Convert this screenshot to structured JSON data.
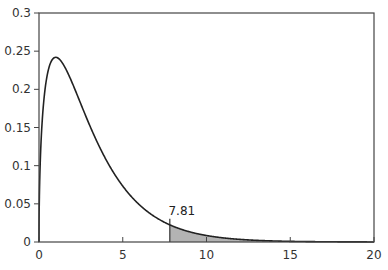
{
  "chart_data": {
    "type": "area",
    "title": "",
    "xlabel": "",
    "ylabel": "",
    "distribution": "chi-square",
    "degrees_of_freedom": 3,
    "xlim": [
      0,
      20
    ],
    "ylim": [
      0,
      0.3
    ],
    "x_ticks": [
      0,
      5,
      10,
      15,
      20
    ],
    "x_tick_labels": [
      "0",
      "5",
      "10",
      "15",
      "20"
    ],
    "y_ticks": [
      0,
      0.05,
      0.1,
      0.15,
      0.2,
      0.25,
      0.3
    ],
    "y_tick_labels": [
      "0",
      "0.05",
      "0.1",
      "0.15",
      "0.2",
      "0.25",
      "0.3"
    ],
    "grid": false,
    "legend": null,
    "series": [
      {
        "name": "density",
        "x": [
          0,
          0.25,
          0.5,
          1,
          1.5,
          2,
          3,
          4,
          5,
          6,
          7,
          7.81,
          9,
          10,
          12,
          15,
          20
        ],
        "values": [
          0,
          0.176,
          0.22,
          0.242,
          0.231,
          0.208,
          0.154,
          0.108,
          0.073,
          0.049,
          0.032,
          0.023,
          0.013,
          0.008,
          0.003,
          0.001,
          0.0001
        ]
      }
    ],
    "shaded_region": {
      "from": 7.81,
      "to": 20,
      "color": "#b3b3b3"
    },
    "annotations": [
      {
        "text": "7.81",
        "x": 7.81,
        "y": 0.023
      }
    ],
    "colors": {
      "curve": "#222222",
      "axis": "#444444",
      "shade": "#b3b3b3"
    }
  }
}
